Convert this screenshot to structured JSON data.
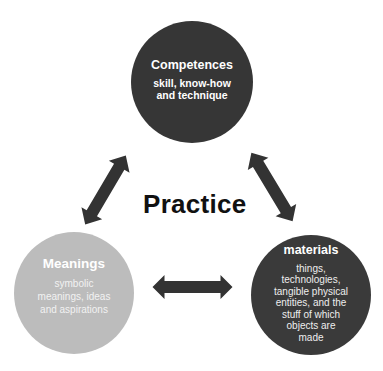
{
  "diagram": {
    "center_label": "Practice",
    "nodes": [
      {
        "id": "competences",
        "title": "Competences",
        "description": "skill, know-how and technique",
        "description_lines": [
          "skill, know-how",
          "and technique"
        ],
        "fill": "#363636"
      },
      {
        "id": "meanings",
        "title": "Meanings",
        "description": "symbolic meanings, ideas and aspirations",
        "description_lines": [
          "symbolic",
          "meanings, ideas",
          "and aspirations"
        ],
        "fill": "#bcbcbc"
      },
      {
        "id": "materials",
        "title": "materials",
        "description": "things, technologies, tangible physical entities, and the stuff of which objects are made",
        "description_lines": [
          "things,",
          "technologies,",
          "tangible physical",
          "entities, and the",
          "stuff of which",
          "objects are",
          "made"
        ],
        "fill": "#3a3a3a"
      }
    ],
    "edges": [
      {
        "from": "competences",
        "to": "meanings",
        "type": "bidirectional"
      },
      {
        "from": "competences",
        "to": "materials",
        "type": "bidirectional"
      },
      {
        "from": "meanings",
        "to": "materials",
        "type": "bidirectional"
      }
    ],
    "arrow_color": "#333333"
  }
}
